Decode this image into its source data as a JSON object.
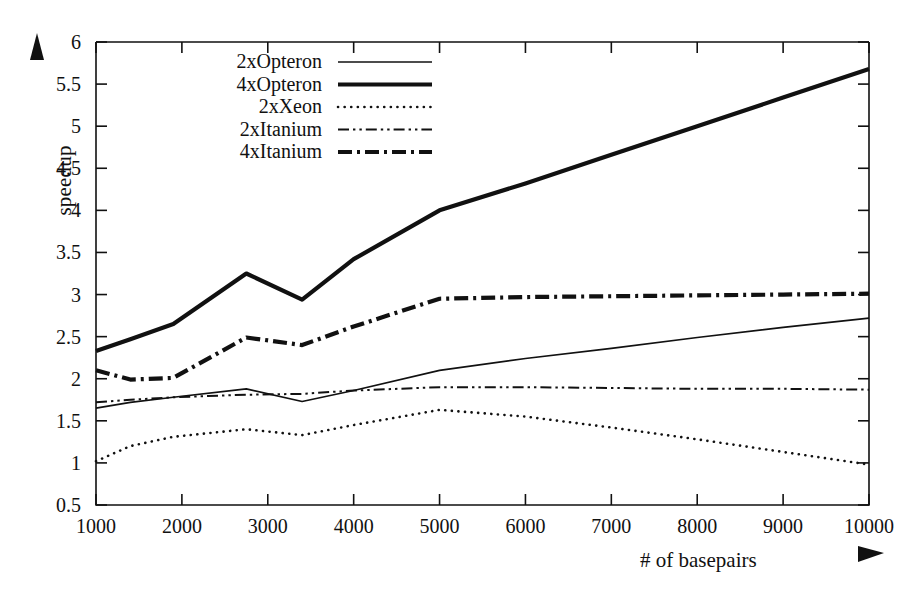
{
  "chart_data": {
    "type": "line",
    "title": "",
    "xlabel": "# of basepairs",
    "ylabel": "speedup",
    "xlim": [
      1000,
      10000
    ],
    "ylim": [
      0.5,
      6
    ],
    "xticks": [
      1000,
      2000,
      3000,
      4000,
      5000,
      6000,
      7000,
      8000,
      9000,
      10000
    ],
    "yticks": [
      0.5,
      1,
      1.5,
      2,
      2.5,
      3,
      3.5,
      4,
      4.5,
      5,
      5.5,
      6
    ],
    "grid": false,
    "legend_position": "top-left-inside",
    "series": [
      {
        "name": "2xOpteron",
        "style": "solid-thin",
        "x": [
          1000,
          1400,
          1900,
          2750,
          3400,
          4000,
          5000,
          6000,
          7000,
          8000,
          9000,
          10000
        ],
        "values": [
          1.65,
          1.72,
          1.78,
          1.88,
          1.73,
          1.86,
          2.1,
          2.24,
          2.36,
          2.49,
          2.61,
          2.72
        ]
      },
      {
        "name": "4xOpteron",
        "style": "solid-thick",
        "x": [
          1000,
          1400,
          1900,
          2750,
          3400,
          4000,
          5000,
          6000,
          7000,
          8000,
          9000,
          10000
        ],
        "values": [
          2.33,
          2.47,
          2.65,
          3.25,
          2.94,
          3.42,
          4.0,
          4.32,
          4.66,
          5.0,
          5.34,
          5.68
        ]
      },
      {
        "name": "2xXeon",
        "style": "dotted",
        "x": [
          1000,
          1400,
          1900,
          2750,
          3400,
          4000,
          5000,
          6000,
          7000,
          8000,
          9000,
          10000
        ],
        "values": [
          1.02,
          1.2,
          1.31,
          1.4,
          1.33,
          1.45,
          1.63,
          1.55,
          1.42,
          1.28,
          1.13,
          0.98
        ]
      },
      {
        "name": "2xItanium",
        "style": "dash-dot-dot-thin",
        "x": [
          1000,
          1400,
          1900,
          2750,
          3400,
          4000,
          5000,
          6000,
          7000,
          8000,
          9000,
          10000
        ],
        "values": [
          1.72,
          1.75,
          1.78,
          1.81,
          1.82,
          1.86,
          1.9,
          1.9,
          1.89,
          1.88,
          1.88,
          1.87
        ]
      },
      {
        "name": "4xItanium",
        "style": "dash-dot-thick",
        "x": [
          1000,
          1400,
          1900,
          2750,
          3400,
          4000,
          5000,
          6000,
          7000,
          8000,
          9000,
          10000
        ],
        "values": [
          2.1,
          1.99,
          2.01,
          2.49,
          2.4,
          2.62,
          2.95,
          2.97,
          2.98,
          2.99,
          3.0,
          3.01
        ]
      }
    ]
  },
  "axes": {
    "y_axis_label": "speedup",
    "x_axis_label": "# of basepairs",
    "y_tick_labels": [
      "0.5",
      "1",
      "1.5",
      "2",
      "2.5",
      "3",
      "3.5",
      "4",
      "4.5",
      "5",
      "5.5",
      "6"
    ],
    "x_tick_labels": [
      "1000",
      "2000",
      "3000",
      "4000",
      "5000",
      "6000",
      "7000",
      "8000",
      "9000",
      "10000"
    ],
    "y_arrow_icon": "up-arrow-icon",
    "x_arrow_icon": "right-arrow-icon"
  },
  "legend": {
    "entries": [
      {
        "label": "2xOpteron",
        "style": "solid-thin"
      },
      {
        "label": "4xOpteron",
        "style": "solid-thick"
      },
      {
        "label": "2xXeon",
        "style": "dotted"
      },
      {
        "label": "2xItanium",
        "style": "dash-dot-dot-thin"
      },
      {
        "label": "4xItanium",
        "style": "dash-dot-thick"
      }
    ]
  },
  "colors": {
    "ink": "#111111",
    "background": "#ffffff"
  }
}
